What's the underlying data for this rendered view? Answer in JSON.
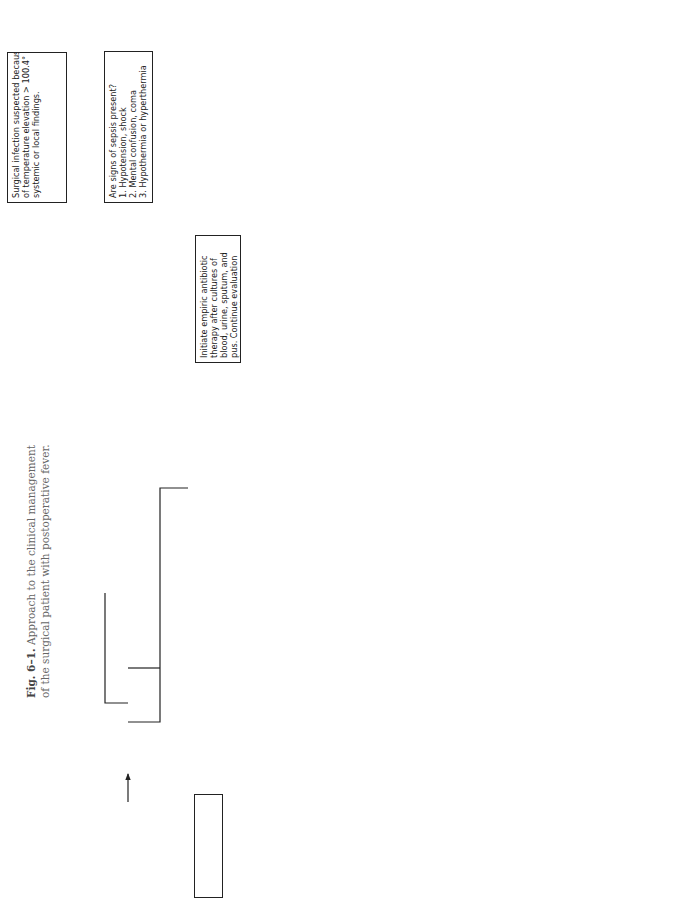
{
  "caption": {
    "figure_number": "Fig. 6–1.",
    "line1": " Approach to the clinical management",
    "line2": "of the surgical patient with postoperative fever."
  },
  "nodes": {
    "start": {
      "lines": [
        "Surgical infection suspected because",
        "of temperature elevation > 100.4° F,",
        "systemic or local findings."
      ]
    },
    "sepsis": {
      "lines": [
        "Are signs of sepsis present?",
        "1. Hypotension, shock",
        "2. Mental confusion, coma",
        "3. Hypothermia or hyperthermia"
      ]
    },
    "empiric": {
      "lines": [
        "Initiate empiric antibiotic",
        "therapy after cultures of",
        "blood, urine, sputum, and",
        "pus. Continue evaluation",
        "for source of infection."
      ]
    },
    "postop_days": {
      "lines": [
        "Is patient 1-2 days",
        "postoperative?"
      ]
    },
    "atelectasis": {
      "lines": [
        "Does chest examination",
        "or radiogram indicate",
        "atelectasis?"
      ]
    },
    "pulmonary_toilet": {
      "lines": [
        "Pulmonary toilet and",
        "mobilization"
      ]
    },
    "toxic": {
      "lines": [
        "Is patient toxic?"
      ]
    },
    "observe": {
      "lines": [
        "Observe carefully."
      ]
    },
    "workup": {
      "lines": [
        "In addition to history and physical",
        "examination, initiate laboratory tests,",
        "including CBC with differential,",
        "platelet count, urinalysis, chest",
        "radiogram and chemistry profile",
        "(including liver function tests),",
        "cultures of blood, urine and sputum."
      ]
    },
    "wound_infected": {
      "lines": [
        "Is wound infected?"
      ]
    },
    "cellulitis": {
      "lines": [
        "Is surrounding cellulitis",
        "present?"
      ]
    },
    "drain_antibiotic": {
      "lines": [
        "Drain wound and institute",
        "antibiotic therapy."
      ]
    },
    "drain_withhold": {
      "lines": [
        "Drain wound and",
        "withhold antibiotics unless",
        "patient is toxic or fails to",
        "defervesce in "
      ],
      "emphasis": "24-48 hrs."
    },
    "urine": {
      "lines": [
        "Are WBCs and",
        "organisms present",
        "in urine?"
      ]
    },
    "treat_uti": {
      "lines": [
        "Obtain culture results and",
        "treat UTI."
      ]
    },
    "pneumonia": {
      "lines": [
        "Does chest radiogram",
        "suggest probable",
        "pneumonia?"
      ]
    },
    "gram_sputum": {
      "lines": [
        "Use results of Gram",
        "stain of sputum to verify",
        "diagnosis and as a",
        "guide to initiate",
        "antibiotic therapy."
      ]
    },
    "iv_site": {
      "lines": [
        "Is intravenous site red,",
        "swollen, or draining",
        "pus?"
      ]
    },
    "remove_catheter": {
      "lines": [
        "Remove catheter and",
        "culture catheter tip and",
        "blood simultaneously.",
        "Gram stain pus or",
        "aspirated material."
      ]
    },
    "treat": {
      "lines": [
        "Treat"
      ]
    },
    "abdominal": {
      "lines": [
        "Is there local abdominal",
        "tenderness, pus at a",
        "drainage site, and/or a",
        "pattern of hectic or",
        "spiking temperatures?"
      ]
    },
    "abscess_search": {
      "lines": [
        "Search for intra-",
        "abdominal abscess",
        "(ultrasound, CAT scan) and",
        "institute antibiotics if",
        "patient is toxic, septic, or if",
        "clinical suspicion is high."
      ]
    },
    "surgical_drainage": {
      "lines": [
        "If abscess is found, institute",
        "antibiotics and prepare",
        "patient for surgical",
        "drainage."
      ]
    },
    "ct_drainage": {
      "lines": [
        "CT drainage of abscess"
      ]
    },
    "all_negative": {
      "lines": [
        "All negative"
      ]
    },
    "continue_observe": {
      "lines": [
        "Continue to observe",
        "patient and initiate further",
        "investigations if patient's",
        "condition indicates."
      ]
    }
  },
  "edge_labels": {
    "sepsis_yes": "YES",
    "sepsis_no": "NO",
    "postop_no": "NO",
    "postop_yes": "YES",
    "atelectasis_no": "NO",
    "atelectasis_yes": "YES",
    "empiric_and": "AND",
    "pulmonary_and": "AND",
    "toxic_yes": "YES",
    "toxic_no": "NO",
    "wound_and": "AND",
    "cellulitis_no": "NO",
    "cellulitis_yes": "YES",
    "urine_yes": "YES",
    "urine_pneumonia_and": "AND",
    "pneumonia_yes": "YES",
    "pneumonia_iv_and": "AND",
    "iv_yes": "YES",
    "catheter_positive": "POSITIVE",
    "iv_abdominal_and": "AND",
    "abdominal_yes": "YES",
    "abscess_positive": "POSITIVE",
    "ct_fail": "FAIL"
  }
}
